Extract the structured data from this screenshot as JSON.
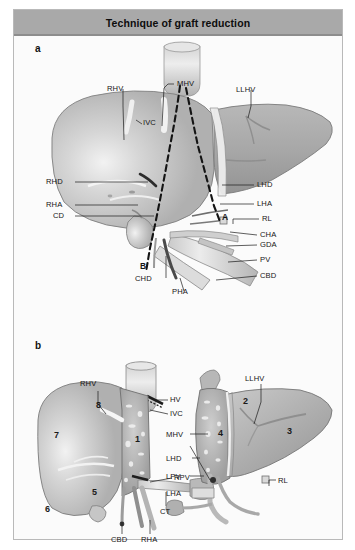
{
  "figure": {
    "title": "Technique of graft reduction",
    "panels": [
      {
        "key": "a",
        "letter": "a"
      },
      {
        "key": "b",
        "letter": "b"
      }
    ]
  },
  "panel_a": {
    "letter": "a",
    "labels": [
      {
        "name": "rhv",
        "text": "RHV"
      },
      {
        "name": "mhv",
        "text": "MHV"
      },
      {
        "name": "llhv",
        "text": "LLHV"
      },
      {
        "name": "ivc",
        "text": "IVC"
      },
      {
        "name": "rhd",
        "text": "RHD"
      },
      {
        "name": "rha",
        "text": "RHA"
      },
      {
        "name": "cd",
        "text": "CD"
      },
      {
        "name": "chd",
        "text": "CHD"
      },
      {
        "name": "pha",
        "text": "PHA"
      },
      {
        "name": "lhd",
        "text": "LHD"
      },
      {
        "name": "lha",
        "text": "LHA"
      },
      {
        "name": "rl",
        "text": "RL"
      },
      {
        "name": "cha",
        "text": "CHA"
      },
      {
        "name": "gda",
        "text": "GDA"
      },
      {
        "name": "pv",
        "text": "PV"
      },
      {
        "name": "cbd",
        "text": "CBD"
      }
    ],
    "cut_markers": [
      {
        "name": "marker-a",
        "text": "A"
      },
      {
        "name": "marker-b",
        "text": "B"
      }
    ]
  },
  "panel_b": {
    "letter": "b",
    "right_graft_labels": [
      {
        "name": "rhv",
        "text": "RHV"
      },
      {
        "name": "hv",
        "text": "HV"
      },
      {
        "name": "ivc",
        "text": "IVC"
      },
      {
        "name": "rpv",
        "text": "RPV"
      },
      {
        "name": "ct",
        "text": "CT"
      },
      {
        "name": "cbd",
        "text": "CBD"
      },
      {
        "name": "rha",
        "text": "RHA"
      }
    ],
    "right_graft_segments": [
      {
        "name": "segment-8",
        "text": "8"
      },
      {
        "name": "segment-7",
        "text": "7"
      },
      {
        "name": "segment-5",
        "text": "5"
      },
      {
        "name": "segment-6",
        "text": "6"
      },
      {
        "name": "segment-1",
        "text": "1"
      }
    ],
    "left_graft_labels": [
      {
        "name": "llhv",
        "text": "LLHV"
      },
      {
        "name": "mhv",
        "text": "MHV"
      },
      {
        "name": "lhd",
        "text": "LHD"
      },
      {
        "name": "lpv",
        "text": "LPV"
      },
      {
        "name": "lha",
        "text": "LHA"
      },
      {
        "name": "rl",
        "text": "RL"
      }
    ],
    "left_graft_segments": [
      {
        "name": "segment-2",
        "text": "2"
      },
      {
        "name": "segment-3",
        "text": "3"
      },
      {
        "name": "segment-4",
        "text": "4"
      }
    ]
  },
  "colors": {
    "title_bar": "#a9a9a9",
    "frame_border": "#b9b9b9",
    "page_background": "#fbfbfb",
    "liver_light": "#d2d2d2",
    "liver_mid": "#b4b4b4",
    "liver_dark": "#9a9a9a",
    "vessel_light": "#e2e2e2",
    "label_text": "#151515"
  }
}
